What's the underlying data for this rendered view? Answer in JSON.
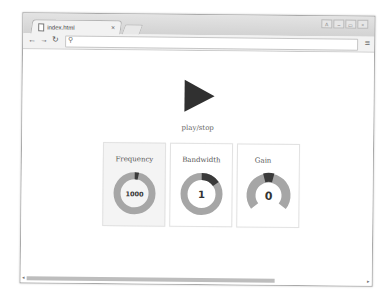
{
  "browser": {
    "tab_title": "index.html",
    "tab_close": "×",
    "nav": {
      "back": "◆",
      "forward": "◆",
      "reload": "↻"
    },
    "omnibox": {
      "value": "",
      "search_glyph": "⚲"
    },
    "menu_glyph": "≡",
    "window_controls": [
      "A",
      "–",
      "▭",
      "×"
    ]
  },
  "page": {
    "play_label": "play/stop",
    "controls": [
      {
        "title": "Frequency",
        "value": "1000",
        "gauge": "ring",
        "fill_fraction": 0.03
      },
      {
        "title": "Bandwidth",
        "value": "1",
        "gauge": "ring",
        "fill_fraction": 0.15
      },
      {
        "title": "Gain",
        "value": "0",
        "gauge": "arc",
        "fill_fraction": 0.1
      }
    ]
  },
  "colors": {
    "gauge_track": "#a6a6a6",
    "gauge_fill": "#3a3a3a",
    "play": "#303030"
  },
  "scrollbar": {
    "left_arrow": "◂",
    "right_arrow": "▸"
  }
}
